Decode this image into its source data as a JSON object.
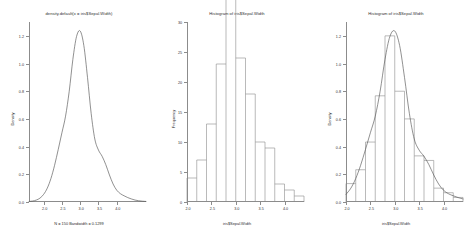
{
  "figure": {
    "background": "#ffffff",
    "axis_color": "#8c8c8c",
    "curve_color": "#555555",
    "panel_count": 3
  },
  "panels": [
    {
      "id": "density-plot",
      "title": "density.default(x = iris$Sepal.Width)",
      "subtitle": "N = 150   Bandwidth = 0.1299",
      "xlabel": "",
      "ylabel": "Density"
    },
    {
      "id": "histogram-frequency",
      "title": "Histogram of iris$Sepal.Width",
      "subtitle": "",
      "xlabel": "iris$Sepal.Width",
      "ylabel": "Frequency"
    },
    {
      "id": "histogram-density",
      "title": "Histogram of iris$Sepal.Width",
      "subtitle": "",
      "xlabel": "iris$Sepal.Width",
      "ylabel": "Density"
    }
  ],
  "chart_data": [
    {
      "type": "line",
      "id": "density-plot",
      "title": "density.default(x = iris$Sepal.Width)",
      "subtitle": "N = 150   Bandwidth = 0.1299",
      "xlabel": "",
      "ylabel": "Density",
      "xlim": [
        1.6,
        4.8
      ],
      "ylim": [
        0.0,
        1.3
      ],
      "xticks": [
        2.0,
        2.5,
        3.0,
        3.5,
        4.0
      ],
      "xticklabels": [
        "2.0",
        "2.5",
        "3.0",
        "3.5",
        "4.0"
      ],
      "yticks": [
        0.0,
        0.2,
        0.4,
        0.6,
        0.8,
        1.0,
        1.2
      ],
      "yticklabels": [
        "0.0",
        "0.2",
        "0.4",
        "0.6",
        "0.8",
        "1.0",
        "1.2"
      ],
      "grid": false,
      "legend": null,
      "series": [
        {
          "name": "Gaussian kernel density",
          "x": [
            1.6,
            1.7,
            1.8,
            1.9,
            2.0,
            2.1,
            2.2,
            2.3,
            2.4,
            2.5,
            2.6,
            2.7,
            2.8,
            2.9,
            3.0,
            3.1,
            3.2,
            3.3,
            3.4,
            3.5,
            3.6,
            3.7,
            3.8,
            3.9,
            4.0,
            4.1,
            4.2,
            4.3,
            4.4,
            4.5,
            4.6,
            4.7,
            4.8
          ],
          "y": [
            0.004,
            0.007,
            0.014,
            0.028,
            0.055,
            0.1,
            0.17,
            0.265,
            0.38,
            0.5,
            0.62,
            0.8,
            1.03,
            1.195,
            1.235,
            1.13,
            0.9,
            0.64,
            0.455,
            0.375,
            0.33,
            0.27,
            0.195,
            0.13,
            0.085,
            0.06,
            0.045,
            0.032,
            0.022,
            0.014,
            0.009,
            0.006,
            0.004
          ]
        }
      ]
    },
    {
      "type": "bar",
      "id": "histogram-frequency",
      "title": "Histogram of iris$Sepal.Width",
      "subtitle": "",
      "xlabel": "iris$Sepal.Width",
      "ylabel": "Frequency",
      "binwidth": 0.2,
      "xlim": [
        2.0,
        4.4
      ],
      "ylim": [
        0,
        30
      ],
      "xticks": [
        2.0,
        2.5,
        3.0,
        3.5,
        4.0
      ],
      "xticklabels": [
        "2.0",
        "2.5",
        "3.0",
        "3.5",
        "4.0"
      ],
      "yticks": [
        0,
        5,
        10,
        15,
        20,
        25,
        30
      ],
      "yticklabels": [
        "0",
        "5",
        "10",
        "15",
        "20",
        "25",
        "30"
      ],
      "grid": false,
      "legend": null,
      "bin_edges": [
        2.0,
        2.2,
        2.4,
        2.6,
        2.8,
        3.0,
        3.2,
        3.4,
        3.6,
        3.8,
        4.0,
        4.2,
        4.4
      ],
      "categories": [
        "2.0-2.2",
        "2.2-2.4",
        "2.4-2.6",
        "2.6-2.8",
        "2.8-3.0",
        "3.0-3.2",
        "3.2-3.4",
        "3.4-3.6",
        "3.6-3.8",
        "3.8-4.0",
        "4.0-4.2",
        "4.2-4.4"
      ],
      "values": [
        4,
        7,
        13,
        23,
        36,
        24,
        18,
        10,
        9,
        3,
        2,
        1
      ]
    },
    {
      "type": "bar",
      "id": "histogram-density",
      "title": "Histogram of iris$Sepal.Width",
      "subtitle": "",
      "xlabel": "iris$Sepal.Width",
      "ylabel": "Density",
      "binwidth": 0.2,
      "xlim": [
        2.0,
        4.4
      ],
      "ylim": [
        0.0,
        1.3
      ],
      "xticks": [
        2.0,
        2.5,
        3.0,
        3.5,
        4.0
      ],
      "xticklabels": [
        "2.0",
        "2.5",
        "3.0",
        "3.5",
        "4.0"
      ],
      "yticks": [
        0.0,
        0.2,
        0.4,
        0.6,
        0.8,
        1.0,
        1.2
      ],
      "yticklabels": [
        "0.0",
        "0.2",
        "0.4",
        "0.6",
        "0.8",
        "1.0",
        "1.2"
      ],
      "grid": false,
      "legend": null,
      "bin_edges": [
        2.0,
        2.2,
        2.4,
        2.6,
        2.8,
        3.0,
        3.2,
        3.4,
        3.6,
        3.8,
        4.0,
        4.2,
        4.4
      ],
      "categories": [
        "2.0-2.2",
        "2.2-2.4",
        "2.4-2.6",
        "2.6-2.8",
        "2.8-3.0",
        "3.0-3.2",
        "3.2-3.4",
        "3.4-3.6",
        "3.6-3.8",
        "3.8-4.0",
        "4.0-4.2",
        "4.2-4.4"
      ],
      "values": [
        0.133,
        0.233,
        0.433,
        0.767,
        1.2,
        0.8,
        0.6,
        0.333,
        0.3,
        0.1,
        0.067,
        0.033
      ],
      "overlay_series": [
        {
          "name": "Gaussian kernel density",
          "x": [
            2.0,
            2.1,
            2.2,
            2.3,
            2.4,
            2.5,
            2.6,
            2.7,
            2.8,
            2.9,
            3.0,
            3.1,
            3.2,
            3.3,
            3.4,
            3.5,
            3.6,
            3.7,
            3.8,
            3.9,
            4.0,
            4.1,
            4.2,
            4.3,
            4.4
          ],
          "y": [
            0.055,
            0.1,
            0.17,
            0.265,
            0.38,
            0.5,
            0.62,
            0.8,
            1.03,
            1.195,
            1.235,
            1.13,
            0.9,
            0.64,
            0.455,
            0.375,
            0.33,
            0.27,
            0.195,
            0.13,
            0.085,
            0.06,
            0.045,
            0.032,
            0.022
          ]
        }
      ]
    }
  ]
}
